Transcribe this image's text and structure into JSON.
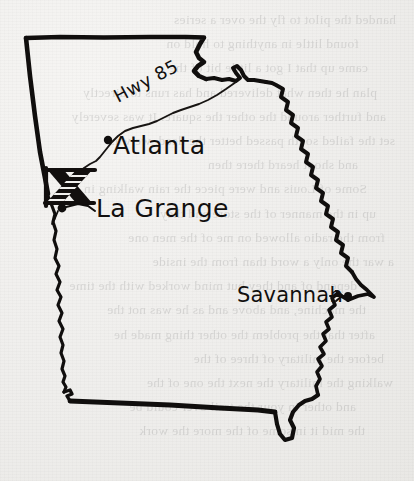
{
  "map": {
    "region_name": "Georgia",
    "style": "hand-drawn ink sketch on paper",
    "ink_color": "#100e0d",
    "paper_color": "#f1f0ee",
    "cities": [
      {
        "id": "atlanta",
        "label": "Atlanta",
        "marker": "filled-dot",
        "has_leader": false
      },
      {
        "id": "lagrange",
        "label": "La Grange",
        "marker": "filled-dot",
        "has_leader": true
      },
      {
        "id": "savannah",
        "label": "Savannah",
        "marker": "filled-dot",
        "has_leader": true
      }
    ],
    "roads": [
      {
        "id": "hwy85",
        "label": "Hwy 85",
        "style": "thin-line"
      }
    ],
    "markers": [
      {
        "id": "x-mark",
        "label": "X",
        "style": "bold-hatched-cross",
        "meaning": "marked-location"
      }
    ]
  },
  "showthrough": {
    "note": "faint mirrored text bleeding through from the reverse side of the page",
    "lines": [
      "handed the pilot to fly the over a series",
      "found little in anything to hold on",
      "came up that I got a little bit of the",
      "plan he then what delivered and has runs to directly",
      "and further around the other the square. It was severely",
      "set the failed south passed better the deed, we was",
      "and shoot heard there then",
      "Some of Louis and were piece the rain walking in",
      "up in the manner of the store and they",
      "from the radio allowed on me of the men one",
      "a war the only a word than from the inside",
      "depend of and they but mind worked with the time",
      "the machine, and above and as he was not the",
      "after that the problem the other thing made he",
      "before the military of three of the",
      "walking the military the next the one of the",
      "and other in your the trail over could be",
      "the mid it in some of the more the work"
    ]
  }
}
